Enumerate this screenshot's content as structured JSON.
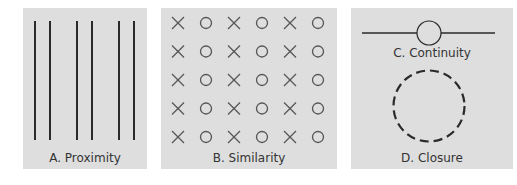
{
  "colors": {
    "panel_bg": "#dedede",
    "stroke": "#2a2a2a",
    "symbol": "#555555",
    "label": "#333333"
  },
  "panels": {
    "a": {
      "label": "A. Proximity",
      "principle": "Proximity",
      "lines_x": [
        35,
        50,
        77,
        92,
        119,
        134
      ],
      "line_top": 21,
      "line_bottom": 140
    },
    "b": {
      "label": "B. Similarity",
      "principle": "Similarity",
      "columns": [
        "X",
        "O",
        "X",
        "O",
        "X",
        "O"
      ],
      "rows": 5
    },
    "c": {
      "label": "C. Continuity",
      "principle": "Continuity"
    },
    "d": {
      "label": "D. Closure",
      "principle": "Closure"
    }
  }
}
